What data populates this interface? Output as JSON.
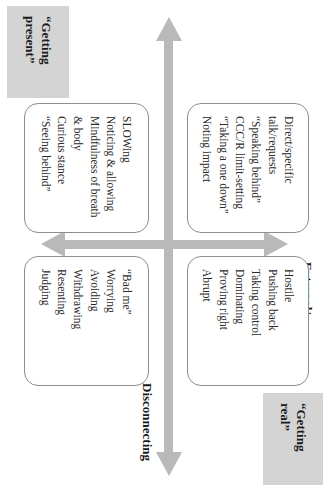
{
  "diagram": {
    "type": "two-by-two-quadrant",
    "orientation_note": "page rotated 90 degrees clockwise",
    "axes": {
      "vertical": {
        "top_label": "External/\ndoing",
        "top_label_line1": "External/",
        "top_label_line2": "doing",
        "bottom_label_line1": "Internal/",
        "bottom_label_line2": "experiencing",
        "arrow_color": "#b9b9b9",
        "double_headed": true
      },
      "horizontal": {
        "right_label": "Disconnecting",
        "left_label": "",
        "arrow_color": "#b9b9b9",
        "double_headed": true
      }
    },
    "corner_labels": [
      {
        "id": "getting-real",
        "line1": "“Getting",
        "line2": "real”",
        "background": "#d4d4d4"
      },
      {
        "id": "getting-present",
        "line1": "“Getting",
        "line2": "present”",
        "background": "#d4d4d4"
      }
    ],
    "quadrants": [
      {
        "id": "top-left",
        "position": "external-doing / connecting",
        "items": [
          "Direct/specific",
          "talk/requests",
          "“Speaking behind”",
          "CCC/R limit-setting",
          "“Taking a one down”",
          "Noting impact"
        ]
      },
      {
        "id": "top-right",
        "position": "external-doing / disconnecting",
        "items": [
          "Hostile",
          "Pushing back",
          "Taking control",
          "Dominating",
          "Proving right",
          "Abrupt"
        ]
      },
      {
        "id": "bottom-left",
        "position": "internal-experiencing / connecting",
        "items": [
          "SLOWing",
          "Noticing & allowing",
          "Mindfulness of breath",
          "& body",
          "Curious stance",
          "“Seeing behind”"
        ]
      },
      {
        "id": "bottom-right",
        "position": "internal-experiencing / disconnecting",
        "items": [
          "“Bad me”",
          "Worrying",
          "Avoiding",
          "Withdrawing",
          "Resenting",
          "Judging"
        ]
      }
    ]
  }
}
